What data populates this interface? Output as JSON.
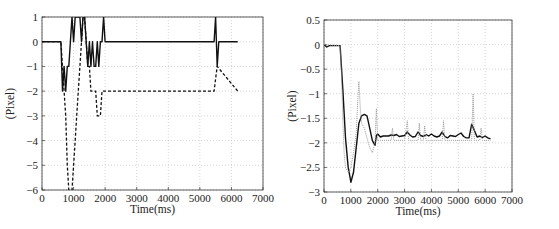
{
  "chart_data": [
    {
      "type": "line",
      "title": "",
      "xlabel": "Time(ms)",
      "ylabel": "(Pixel)",
      "xlim": [
        0,
        7000
      ],
      "ylim": [
        -6,
        1
      ],
      "xticks": [
        0,
        1000,
        2000,
        3000,
        4000,
        5000,
        6000,
        7000
      ],
      "yticks": [
        1,
        0,
        -1,
        -2,
        -3,
        -4,
        -5,
        -6
      ],
      "grid": true,
      "legend": null,
      "series": [
        {
          "name": "solid",
          "style": "solid",
          "x": [
            0,
            600,
            650,
            700,
            750,
            800,
            850,
            900,
            950,
            1000,
            1050,
            1100,
            1150,
            1200,
            1250,
            1300,
            1350,
            1400,
            1450,
            1500,
            1550,
            1600,
            1650,
            1700,
            1750,
            1800,
            1850,
            1900,
            1950,
            2000,
            2050,
            5450,
            5500,
            5550,
            5600,
            6200
          ],
          "y": [
            0,
            0,
            -2,
            -1,
            -2,
            -1,
            -1,
            0,
            1,
            0,
            1,
            1,
            1,
            1,
            0,
            1,
            1,
            0,
            -1,
            0,
            -1,
            0,
            -1,
            -1,
            0,
            -1,
            0,
            0,
            1,
            0,
            0,
            0,
            1,
            -1,
            0,
            0
          ]
        },
        {
          "name": "dashed",
          "style": "dashed",
          "x": [
            0,
            600,
            650,
            700,
            750,
            800,
            850,
            900,
            950,
            1000,
            1050,
            1100,
            1150,
            1200,
            1250,
            1300,
            1350,
            1400,
            1450,
            1500,
            1550,
            1600,
            1650,
            1700,
            1750,
            1800,
            1850,
            1900,
            1950,
            2000,
            5400,
            5450,
            5500,
            5550,
            6200
          ],
          "y": [
            0,
            0,
            -1,
            -2,
            -3,
            -5,
            -6,
            -6,
            -6,
            -5,
            -4,
            -3,
            -2,
            -1,
            0,
            1,
            1,
            0,
            -1,
            -1,
            -2,
            -2,
            -2,
            -2,
            -3,
            -3,
            -3,
            -2,
            -2,
            -2,
            -2,
            -2,
            -1.5,
            -1,
            -2
          ]
        }
      ]
    },
    {
      "type": "line",
      "title": "",
      "xlabel": "Time(ms)",
      "ylabel": "(Pixel)",
      "xlim": [
        0,
        7000
      ],
      "ylim": [
        -3,
        0.5
      ],
      "xticks": [
        0,
        1000,
        2000,
        3000,
        4000,
        5000,
        6000,
        7000
      ],
      "yticks": [
        0.5,
        0,
        -0.5,
        -1,
        -1.5,
        -2,
        -2.5,
        -3
      ],
      "grid": true,
      "legend": null,
      "series": [
        {
          "name": "solid",
          "style": "solid",
          "x": [
            0,
            100,
            200,
            600,
            700,
            800,
            900,
            1000,
            1100,
            1200,
            1300,
            1400,
            1500,
            1600,
            1700,
            1800,
            1900,
            1950,
            2000,
            2100,
            2200,
            2400,
            2500,
            2600,
            2700,
            2800,
            2900,
            3000,
            3100,
            3200,
            3300,
            3400,
            3500,
            3600,
            3700,
            3800,
            3900,
            4000,
            4100,
            4200,
            4300,
            4400,
            4500,
            4600,
            4700,
            4800,
            4900,
            5000,
            5100,
            5200,
            5300,
            5400,
            5500,
            5600,
            5700,
            5800,
            5900,
            6000,
            6100,
            6200
          ],
          "y": [
            0,
            -0.05,
            -0.02,
            -0.02,
            -0.9,
            -1.9,
            -2.5,
            -2.8,
            -2.6,
            -2.1,
            -1.6,
            -1.45,
            -1.42,
            -1.45,
            -1.7,
            -1.95,
            -2.05,
            -1.85,
            -1.82,
            -1.88,
            -1.86,
            -1.86,
            -1.84,
            -1.85,
            -1.83,
            -1.87,
            -1.86,
            -1.85,
            -1.78,
            -1.84,
            -1.88,
            -1.87,
            -1.78,
            -1.85,
            -1.87,
            -1.83,
            -1.86,
            -1.82,
            -1.86,
            -1.88,
            -1.86,
            -1.78,
            -1.87,
            -1.9,
            -1.85,
            -1.86,
            -1.87,
            -1.83,
            -1.8,
            -1.87,
            -1.9,
            -1.9,
            -1.62,
            -1.75,
            -1.88,
            -1.86,
            -1.89,
            -1.86,
            -1.9,
            -1.92
          ]
        },
        {
          "name": "dotted",
          "style": "dotted",
          "x": [
            0,
            600,
            650,
            700,
            750,
            800,
            900,
            1000,
            1100,
            1200,
            1250,
            1300,
            1350,
            1400,
            1500,
            1600,
            1700,
            1800,
            1900,
            1950,
            2000,
            2100,
            2500,
            2550,
            2600,
            3000,
            3100,
            3150,
            3200,
            3500,
            3550,
            3600,
            3700,
            3750,
            3800,
            4400,
            4450,
            4500,
            5000,
            5500,
            5550,
            5600,
            5800,
            5850,
            5900,
            6200
          ],
          "y": [
            0,
            -0.02,
            -0.6,
            -1.5,
            -2.2,
            -2.5,
            -2.6,
            -2.5,
            -2.2,
            -1.8,
            -1.2,
            -0.75,
            -1.3,
            -1.6,
            -1.7,
            -1.9,
            -2.1,
            -2.2,
            -2.0,
            -1.3,
            -1.95,
            -1.95,
            -1.95,
            -1.7,
            -1.95,
            -1.95,
            -1.55,
            -1.95,
            -1.95,
            -1.95,
            -1.6,
            -1.95,
            -1.95,
            -1.65,
            -1.95,
            -1.95,
            -1.55,
            -1.95,
            -1.95,
            -1.95,
            -1.0,
            -1.95,
            -1.95,
            -1.7,
            -1.95,
            -1.95
          ]
        }
      ]
    }
  ],
  "charts": {
    "left": {
      "xlabel": "Time(ms)",
      "ylabel": "(Pixel)"
    },
    "right": {
      "xlabel": "Time(ms)",
      "ylabel": "(Pixel)"
    }
  }
}
